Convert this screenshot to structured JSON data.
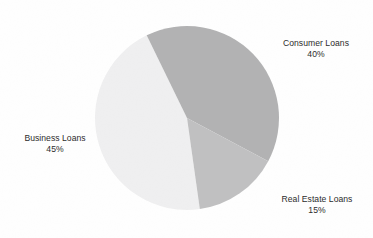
{
  "chart_data": {
    "type": "pie",
    "title": "",
    "subtitle": "",
    "xlabel": "",
    "ylabel": "",
    "legend_position": "none",
    "grid": false,
    "labels_outside": true,
    "unit": "%",
    "categories": [
      "Business Loans",
      "Consumer Loans",
      "Real Estate Loans"
    ],
    "values": [
      45,
      40,
      15
    ],
    "slices": [
      {
        "name": "Business Loans",
        "value": 45,
        "value_text": "45%",
        "color": "#ededee",
        "label_position": "left"
      },
      {
        "name": "Consumer Loans",
        "value": 40,
        "value_text": "40%",
        "color": "#a9a9aa",
        "label_position": "right-top"
      },
      {
        "name": "Real Estate Loans",
        "value": 15,
        "value_text": "15%",
        "color": "#b9b9ba",
        "label_position": "right-bottom"
      }
    ],
    "total": 100,
    "start_angle_deg": -26
  },
  "figure": {
    "background_color": "#fefefe",
    "text_color": "#2c2c2c",
    "center_x": 187,
    "center_y": 118,
    "radius": 92
  }
}
